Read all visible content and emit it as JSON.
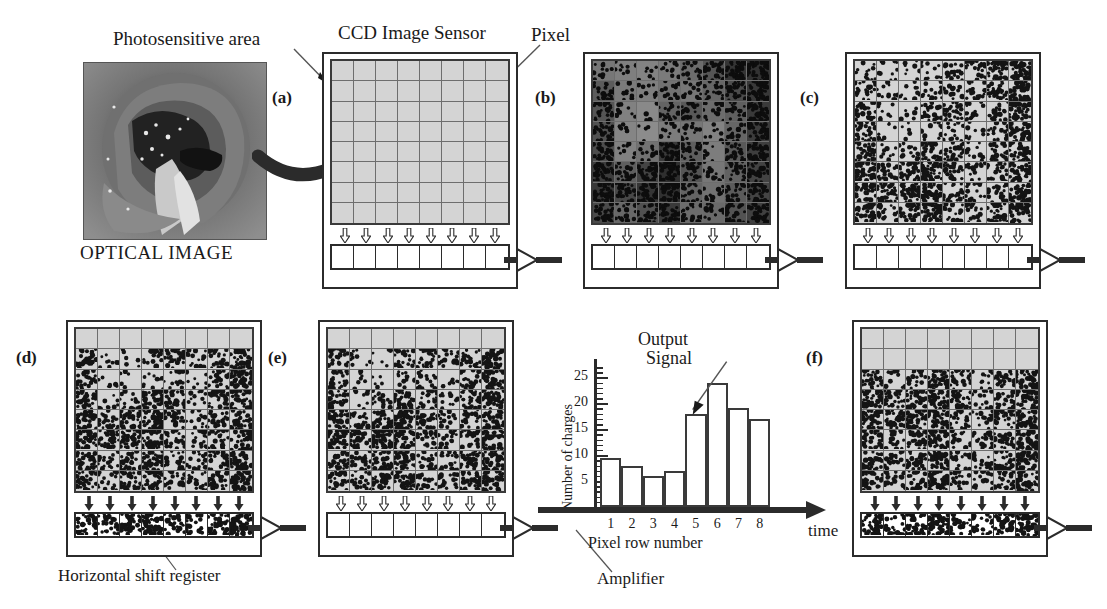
{
  "figure": {
    "title_labels": {
      "photosensitive_area": "Photosensitive area",
      "ccd_image_sensor": "CCD Image Sensor",
      "pixel": "Pixel",
      "optical_image": "OPTICAL IMAGE",
      "horizontal_shift_register": "Horizontal shift register",
      "amplifier": "Amplifier",
      "output_signal": "Output\nSignal"
    },
    "output_signal_line1": "Output",
    "output_signal_line2": "Signal"
  },
  "panels": [
    {
      "id": "a",
      "label": "(a)",
      "state": "empty-grid",
      "filled_rows": 0,
      "register": "empty",
      "arrows": "hollow"
    },
    {
      "id": "b",
      "label": "(b)",
      "state": "optical-exposed",
      "filled_rows": 8,
      "register": "empty",
      "arrows": "hollow"
    },
    {
      "id": "c",
      "label": "(c)",
      "state": "charge-packets",
      "filled_rows": 8,
      "register": "empty",
      "arrows": "hollow"
    },
    {
      "id": "d",
      "label": "(d)",
      "state": "shifted-one-row",
      "filled_rows": 7,
      "register": "filled",
      "arrows": "solid"
    },
    {
      "id": "e",
      "label": "(e)",
      "state": "register-drained",
      "filled_rows": 7,
      "register": "empty",
      "arrows": "hollow"
    },
    {
      "id": "f",
      "label": "(f)",
      "state": "shifted-two-rows",
      "filled_rows": 6,
      "register": "filled",
      "arrows": "solid"
    }
  ],
  "chart_data": {
    "type": "bar",
    "title": "",
    "categories": [
      "1",
      "2",
      "3",
      "4",
      "5",
      "6",
      "7",
      "8"
    ],
    "values": [
      9.5,
      8,
      6,
      7,
      18,
      24,
      19,
      17
    ],
    "xlabel": "Pixel row number",
    "ylabel": "Number of charges",
    "axis_end_label": "time",
    "ylim": [
      0,
      27
    ],
    "yticks_major": [
      5,
      10,
      15,
      20,
      25
    ],
    "ytick_labels": [
      "5",
      "10",
      "15",
      "20",
      "25"
    ],
    "grid": false,
    "legend": null,
    "annotations": [
      {
        "text": "Output Signal",
        "points_to_category": "5"
      }
    ]
  },
  "colors": {
    "ink": "#1a1a1a",
    "grid_fill": "#d4d4d4",
    "grid_line": "#6e6e6e",
    "frame": "#2b2b2b",
    "charge_dot": "#141414"
  }
}
